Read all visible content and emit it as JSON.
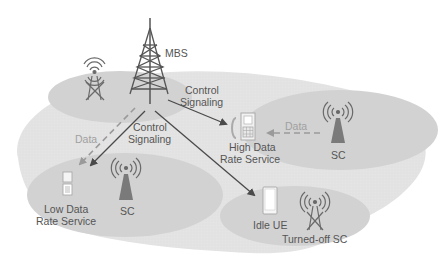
{
  "diagram": {
    "type": "heterogeneous-network",
    "colors": {
      "background": "#ffffff",
      "outer_coverage": "#e0e0e0",
      "inner_cell": "#cfcfcf",
      "tower": "#555555",
      "arrow_control": "#4a4a4a",
      "arrow_data": "#9a9a9a",
      "text": "#555555",
      "text_light": "#a0a0a0"
    },
    "labels": {
      "mbs": "MBS",
      "control_top": "Control",
      "signaling_top": "Signaling",
      "control_mid": "Control",
      "signaling_mid": "Signaling",
      "data_left": "Data",
      "data_right": "Data",
      "high_data_1": "High Data",
      "high_data_2": "Rate Service",
      "sc_right": "SC",
      "low_data_1": "Low Data",
      "low_data_2": "Rate Service",
      "sc_left": "SC",
      "idle_ue": "Idle UE",
      "turned_off_sc": "Turned-off SC"
    },
    "nodes": [
      {
        "id": "mbs",
        "kind": "macro-base-station",
        "label": "MBS"
      },
      {
        "id": "sc-topleft",
        "kind": "small-cell",
        "state": "turned-off"
      },
      {
        "id": "sc-right",
        "kind": "small-cell",
        "label": "SC"
      },
      {
        "id": "sc-left",
        "kind": "small-cell",
        "label": "SC"
      },
      {
        "id": "sc-bottom",
        "kind": "small-cell",
        "state": "turned-off",
        "label": "Turned-off SC"
      },
      {
        "id": "ue-high",
        "kind": "user-equipment",
        "label": "High Data Rate Service"
      },
      {
        "id": "ue-low",
        "kind": "user-equipment",
        "label": "Low Data Rate Service"
      },
      {
        "id": "ue-idle",
        "kind": "user-equipment",
        "label": "Idle UE"
      }
    ],
    "edges": [
      {
        "from": "mbs",
        "to": "ue-high",
        "type": "control",
        "label": "Control Signaling"
      },
      {
        "from": "mbs",
        "to": "ue-low",
        "type": "control",
        "label": "Control Signaling"
      },
      {
        "from": "mbs",
        "to": "ue-idle",
        "type": "control"
      },
      {
        "from": "mbs",
        "to": "ue-low",
        "type": "data",
        "style": "dashed",
        "label": "Data"
      },
      {
        "from": "sc-right",
        "to": "ue-high",
        "type": "data",
        "style": "dashed",
        "label": "Data"
      }
    ]
  }
}
